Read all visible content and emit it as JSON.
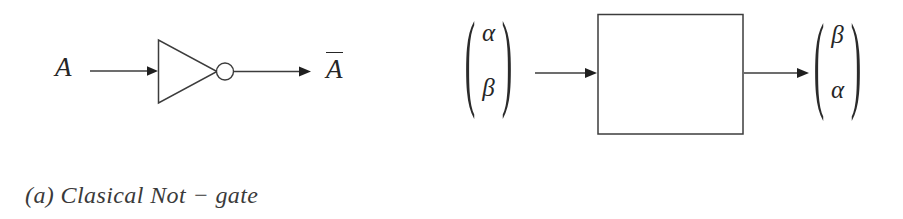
{
  "figure": {
    "background_color": "#ffffff",
    "line_color": "#3c3c3c",
    "text_color": "#262626"
  },
  "panels": [
    {
      "id": "classical",
      "caption": "(a) Clasical Not − gate",
      "input_label": "A",
      "output_label": "A",
      "output_has_overline": true,
      "gate": {
        "type": "not-gate",
        "shape": "triangle-with-bubble",
        "label": ""
      }
    },
    {
      "id": "quantum",
      "caption": "(b) Quantum X − gate",
      "gate": {
        "type": "x-gate",
        "shape": "box",
        "label": "X"
      },
      "input_vector": {
        "top": "α",
        "bottom": "β",
        "open_paren": "(",
        "close_paren": ")"
      },
      "output_vector": {
        "top": "β",
        "bottom": "α",
        "open_paren": "(",
        "close_paren": ")"
      }
    }
  ],
  "icons": {
    "arrow_right": "arrow-right-icon",
    "inverter_bubble": "inversion-bubble-icon"
  }
}
